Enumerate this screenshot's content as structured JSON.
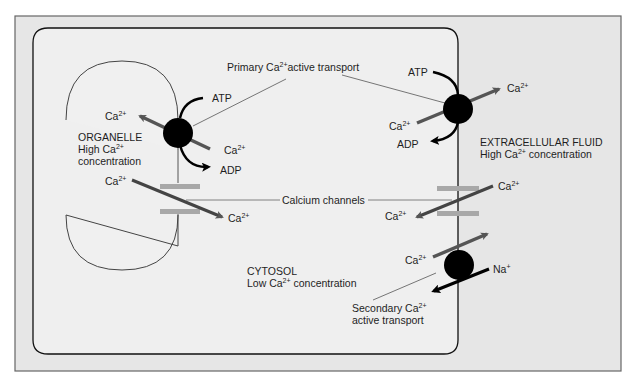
{
  "colors": {
    "frame_fill": "#e6e6e6",
    "frame_border": "#666666",
    "cell_fill": "#efefef",
    "cell_border": "#111111",
    "organelle_border": "#444444",
    "pump": "#000000",
    "ion_arrow": "#555555",
    "channel_bar": "#a8a8a8",
    "leader_line": "#555555"
  },
  "labels": {
    "primary_transport": {
      "pre": "Primary Ca",
      "sup": "2+",
      "post": "active transport"
    },
    "calcium_channels": "Calcium channels",
    "organelle": {
      "line1": "ORGANELLE",
      "line2_pre": "High Ca",
      "line2_sup": "2+",
      "line3": "concentration"
    },
    "extracellular": {
      "line1": "EXTRACELLULAR FLUID",
      "line2_pre": "High Ca",
      "line2_sup": "2+",
      "line2_post": " concentration"
    },
    "cytosol": {
      "line1": "CYTOSOL",
      "line2_pre": "Low Ca",
      "line2_sup": "2+",
      "line2_post": " concentration"
    },
    "secondary_transport": {
      "line1_pre": "Secondary Ca",
      "line1_sup": "2+",
      "line2": "active transport"
    },
    "ion_ca": "Ca",
    "ion_ca_sup": "2+",
    "ion_na": "Na",
    "ion_na_sup": "+",
    "atp": "ATP",
    "adp": "ADP"
  }
}
